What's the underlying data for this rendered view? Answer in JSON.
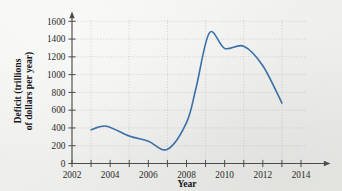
{
  "figure": {
    "background_color": "#f1f1ef"
  },
  "chart_data": {
    "type": "line",
    "title": "",
    "xlabel": "Year",
    "ylabel_line1": "Deficit (trillions",
    "ylabel_line2": "of dollars per year)",
    "line_color": "#3a6fa8",
    "grid": true,
    "grid_color": "#a9a9a9",
    "legend": "none",
    "xlim": [
      2002,
      2014
    ],
    "ylim": [
      0,
      1600
    ],
    "x_ticks": [
      2002,
      2003,
      2004,
      2005,
      2006,
      2007,
      2008,
      2009,
      2010,
      2011,
      2012,
      2013,
      2014
    ],
    "x_tick_labels": [
      "2002",
      "",
      "2004",
      "",
      "2006",
      "",
      "2008",
      "",
      "2010",
      "",
      "2012",
      "",
      "2014"
    ],
    "x_major_labels": [
      "2002",
      "2004",
      "2006",
      "2008",
      "2010",
      "2012",
      "2014"
    ],
    "x_gridlines": [
      2003,
      2005,
      2007,
      2009,
      2011,
      2013
    ],
    "y_ticks": [
      0,
      200,
      400,
      600,
      800,
      1000,
      1200,
      1400,
      1600
    ],
    "y_tick_labels": [
      "0",
      "200",
      "400",
      "600",
      "800",
      "1000",
      "1200",
      "1400",
      "1600"
    ],
    "y_gridlines": [
      200,
      400,
      600,
      800,
      1000,
      1200,
      1400,
      1600
    ],
    "x": [
      2003,
      2003.8,
      2005,
      2006,
      2007,
      2008,
      2008.5,
      2009.2,
      2010,
      2011,
      2012,
      2013
    ],
    "values": [
      380,
      420,
      310,
      250,
      160,
      460,
      850,
      1470,
      1295,
      1320,
      1100,
      680
    ],
    "series": [
      {
        "name": "Deficit",
        "x": [
          2003,
          2003.8,
          2005,
          2006,
          2007,
          2008,
          2008.5,
          2009.2,
          2010,
          2011,
          2012,
          2013
        ],
        "values": [
          380,
          420,
          310,
          250,
          160,
          460,
          850,
          1470,
          1295,
          1320,
          1100,
          680
        ]
      }
    ]
  }
}
